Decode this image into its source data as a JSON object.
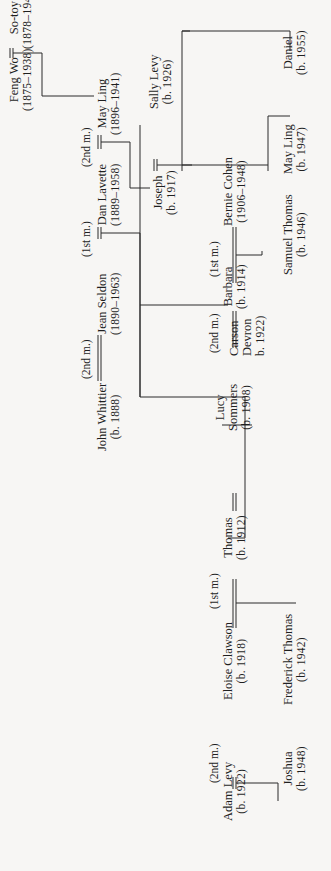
{
  "diagram": {
    "type": "family-tree",
    "orientation": "rotated-90-ccw",
    "line_color": "#2a2a2a",
    "people": [
      {
        "id": "so_toy",
        "name": "So-toy",
        "dates": "(1878–1940)"
      },
      {
        "id": "feng_wo",
        "name": "Feng Wo",
        "dates": "(1875–1938)"
      },
      {
        "id": "may_ling_1896",
        "name": "May Ling",
        "dates": "(1896–1941)"
      },
      {
        "id": "dan_lavette",
        "name": "Dan Lavette",
        "dates": "(1889–1958)"
      },
      {
        "id": "jean_seldon",
        "name": "Jean Seldon",
        "dates": "(1890–1963)"
      },
      {
        "id": "john_whittier",
        "name": "John Whittier",
        "dates": "(b. 1888)"
      },
      {
        "id": "sally_levy",
        "name": "Sally Levy",
        "dates": "(b. 1926)"
      },
      {
        "id": "joseph",
        "name": "Joseph",
        "dates": "(b. 1917)"
      },
      {
        "id": "bernie_cohen",
        "name": "Bernie Cohen",
        "dates": "(1906–1948)"
      },
      {
        "id": "barbara",
        "name": "Barbara",
        "dates": "(b. 1914)"
      },
      {
        "id": "carson_devron",
        "name_line1": "Carson",
        "name_line2": "Devron",
        "dates": "b. 1922)"
      },
      {
        "id": "lucy_sommers",
        "name_line1": "Lucy",
        "name_line2": "Sommers",
        "dates": "(b. 1908)"
      },
      {
        "id": "thomas",
        "name": "Thomas",
        "dates": "(b. 1912)"
      },
      {
        "id": "eloise_clawson",
        "name": "Eloise Clawson",
        "dates": "(b. 1918)"
      },
      {
        "id": "adam_levy",
        "name": "Adam Levy",
        "dates": "(b. 1922)"
      },
      {
        "id": "daniel",
        "name": "Daniel",
        "dates": "(b. 1955)"
      },
      {
        "id": "may_ling_1947",
        "name": "May Ling",
        "dates": "(b. 1947)"
      },
      {
        "id": "samuel_thomas",
        "name": "Samuel Thomas",
        "dates": "(b. 1946)"
      },
      {
        "id": "frederick_thomas",
        "name": "Frederick Thomas",
        "dates": "(b. 1942)"
      },
      {
        "id": "joshua",
        "name": "Joshua",
        "dates": "(b. 1948)"
      }
    ],
    "marriage_labels": {
      "dan_may": "(2nd m.)",
      "jean_dan": "(1st m.)",
      "john_jean": "(2nd m.)",
      "barbara_bernie": "(1st m.)",
      "carson_barbara": "(2nd m.)",
      "eloise_thomas": "(1st m.)",
      "adam_eloise": "(2nd m.)"
    }
  }
}
